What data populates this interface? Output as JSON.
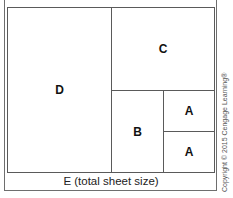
{
  "diagram": {
    "regions": {
      "D": "D",
      "C": "C",
      "B": "B",
      "A_top": "A",
      "A_bottom": "A"
    },
    "caption": "E (total sheet size)",
    "copyright": "Copyright © 2015 Cengage Learning®"
  }
}
